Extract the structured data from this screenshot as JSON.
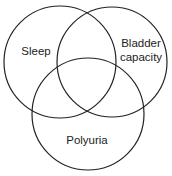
{
  "diagram": {
    "type": "venn",
    "sets": [
      {
        "label_lines": [
          "Sleep"
        ]
      },
      {
        "label_lines": [
          "Bladder",
          "capacity"
        ]
      },
      {
        "label_lines": [
          "Polyuria"
        ]
      }
    ],
    "stroke_color": "#222222",
    "background": "#ffffff"
  }
}
